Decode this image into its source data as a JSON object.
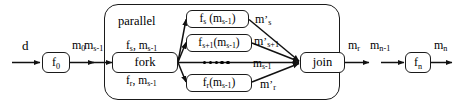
{
  "diagram": {
    "stroke_color": "#1a1a1a",
    "background_color": "#ffffff",
    "stages": {
      "input_stage": {
        "input_label": "d",
        "node_label": "f0",
        "output_label": "m0"
      },
      "parallel_stage": {
        "container_label": "parallel",
        "input_label": "ms-1",
        "fork_label": "fork",
        "join_label": "join",
        "join_output_label": "mr",
        "branch_top": {
          "edge_in_label": "fs, ms-1",
          "node_label": "fs (ms-1)",
          "edge_out_label": "m's"
        },
        "branch_second": {
          "node_label": "fs+1(ms-1)",
          "edge_out_label": "m's+1"
        },
        "branch_middle": {
          "dots": "•••••",
          "edge_out_label": "ms-1"
        },
        "branch_bottom": {
          "edge_in_label": "fr, ms-1",
          "node_label": "fr(ms-1)",
          "edge_out_label": "m'r"
        }
      },
      "output_stage": {
        "input_label": "mn-1",
        "node_label": "fn",
        "output_label": "mn"
      }
    }
  }
}
